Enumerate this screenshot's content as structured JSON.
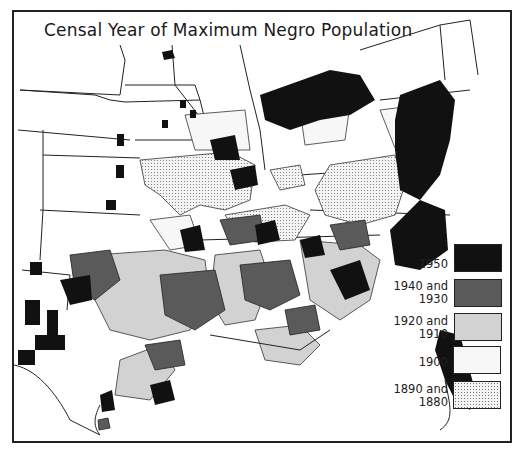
{
  "title": "Censal Year of Maximum Negro Population",
  "legend": {
    "items": [
      {
        "label_line1": "1950",
        "label_line2": "",
        "fill": "#111111",
        "pattern": "solid"
      },
      {
        "label_line1": "1940 and",
        "label_line2": "1930",
        "fill": "#5a5a5a",
        "pattern": "solid"
      },
      {
        "label_line1": "1920 and",
        "label_line2": "1910",
        "fill": "#d2d2d2",
        "pattern": "solid"
      },
      {
        "label_line1": "1900",
        "label_line2": "",
        "fill": "#f7f7f7",
        "pattern": "solid"
      },
      {
        "label_line1": "1890 and",
        "label_line2": "1880",
        "fill": "#f4f4f4",
        "pattern": "dotted"
      }
    ]
  },
  "map": {
    "region": "Eastern United States",
    "unit": "county",
    "colors": {
      "c1950": "#111111",
      "c1940_1930": "#5a5a5a",
      "c1920_1910": "#d2d2d2",
      "c1900": "#f7f7f7",
      "c1890_1880": "#ececec",
      "border": "#222222",
      "water": "#ffffff"
    }
  }
}
